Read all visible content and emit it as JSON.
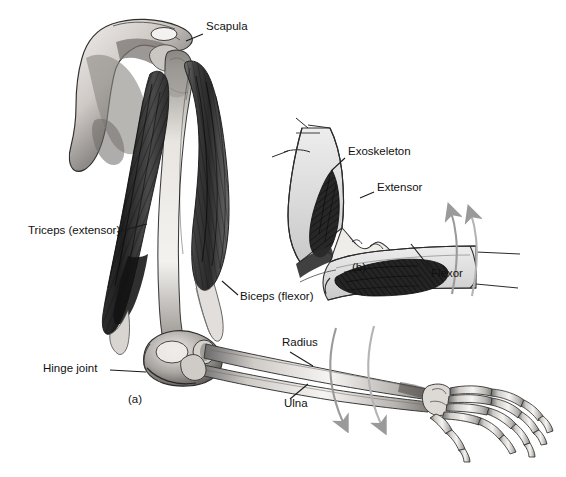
{
  "figure": {
    "background_color": "#ffffff",
    "width": 566,
    "height": 477
  },
  "panels": [
    {
      "id": "a",
      "caption": "(a)",
      "description": "Human arm skeleton with antagonistic muscles",
      "caption_x": 128,
      "caption_y": 394
    },
    {
      "id": "b",
      "caption": "(b)",
      "description": "Arthropod limb with exoskeleton and internal muscles",
      "caption_x": 352,
      "caption_y": 262
    }
  ],
  "labels": [
    {
      "name": "scapula",
      "text": "Scapula",
      "x": 206,
      "y": 27,
      "leader": {
        "x1": 203,
        "y1": 34,
        "x2": 186,
        "y2": 41
      }
    },
    {
      "name": "triceps",
      "text": "Triceps (extensor)",
      "x": 28,
      "y": 231,
      "leader": {
        "x1": 117,
        "y1": 232,
        "x2": 147,
        "y2": 224
      }
    },
    {
      "name": "biceps",
      "text": "Biceps (flexor)",
      "x": 240,
      "y": 297,
      "leader": {
        "x1": 238,
        "y1": 295,
        "x2": 222,
        "y2": 281
      }
    },
    {
      "name": "hinge-joint",
      "text": "Hinge joint",
      "x": 43,
      "y": 369,
      "leader": {
        "x1": 110,
        "y1": 370,
        "x2": 146,
        "y2": 372
      }
    },
    {
      "name": "radius",
      "text": "Radius",
      "x": 282,
      "y": 343,
      "leader": {
        "x1": 290,
        "y1": 352,
        "x2": 313,
        "y2": 366
      }
    },
    {
      "name": "ulna",
      "text": "Ulna",
      "x": 284,
      "y": 404,
      "leader": {
        "x1": 290,
        "y1": 399,
        "x2": 308,
        "y2": 384
      }
    },
    {
      "name": "exoskeleton",
      "text": "Exoskeleton",
      "x": 348,
      "y": 152,
      "leader": {
        "x1": 345,
        "y1": 158,
        "x2": 331,
        "y2": 171
      }
    },
    {
      "name": "extensor",
      "text": "Extensor",
      "x": 377,
      "y": 188,
      "leader": {
        "x1": 374,
        "y1": 192,
        "x2": 360,
        "y2": 198
      }
    },
    {
      "name": "flexor",
      "text": "Flexor",
      "x": 431,
      "y": 274,
      "leader": {
        "x1": 430,
        "y1": 268,
        "x2": 411,
        "y2": 244
      }
    }
  ],
  "motion_arrows": [
    {
      "name": "forearm-rotation-arrow-left",
      "panel": "a",
      "direction": "down"
    },
    {
      "name": "forearm-rotation-arrow-right",
      "panel": "a",
      "direction": "down"
    },
    {
      "name": "limb-rotation-arrow-left",
      "panel": "b",
      "direction": "up"
    },
    {
      "name": "limb-rotation-arrow-right",
      "panel": "b",
      "direction": "up"
    }
  ],
  "colors": {
    "label_text": "#111111",
    "leader_line": "#1a1a1a",
    "motion_arrow": "#9a9a9a",
    "bone_outline": "#3a3a3a",
    "bone_fill": "#f2f0ee",
    "muscle_dark": "#2b2b2b",
    "muscle_mid": "#6e6e6e",
    "exoskeleton_fill": "#dcdcdc"
  },
  "anatomy_parts": [
    "scapula",
    "humerus",
    "triceps-muscle",
    "biceps-muscle",
    "elbow-hinge-joint",
    "radius-bone",
    "ulna-bone",
    "carpal-bones",
    "metacarpal-bones",
    "phalanx-bones",
    "arthropod-exoskeleton",
    "arthropod-extensor-muscle",
    "arthropod-flexor-muscle",
    "arthropod-joint-condyle"
  ]
}
